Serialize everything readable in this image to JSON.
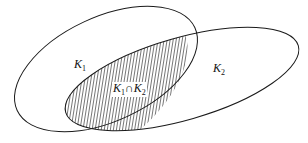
{
  "diagram": {
    "sets": [
      {
        "name": "K",
        "sub": "1"
      },
      {
        "name": "K",
        "sub": "2"
      }
    ],
    "intersection": {
      "a": "K",
      "a_sub": "1",
      "op": "∩",
      "b": "K",
      "b_sub": "2"
    },
    "colors": {
      "stroke": "#1a1a1a",
      "hatch": "#1a1a1a",
      "background": "#ffffff"
    }
  }
}
